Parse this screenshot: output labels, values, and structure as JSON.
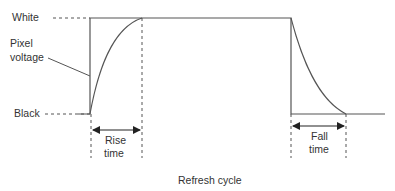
{
  "diagram": {
    "labels": {
      "white": "White",
      "pixel_voltage_line1": "Pixel",
      "pixel_voltage_line2": "voltage",
      "black": "Black",
      "rise_line1": "Rise",
      "rise_line2": "time",
      "fall_line1": "Fall",
      "fall_line2": "time",
      "refresh_cycle": "Refresh cycle"
    },
    "colors": {
      "stroke": "#555555",
      "text": "#333333",
      "background": "#ffffff"
    }
  }
}
